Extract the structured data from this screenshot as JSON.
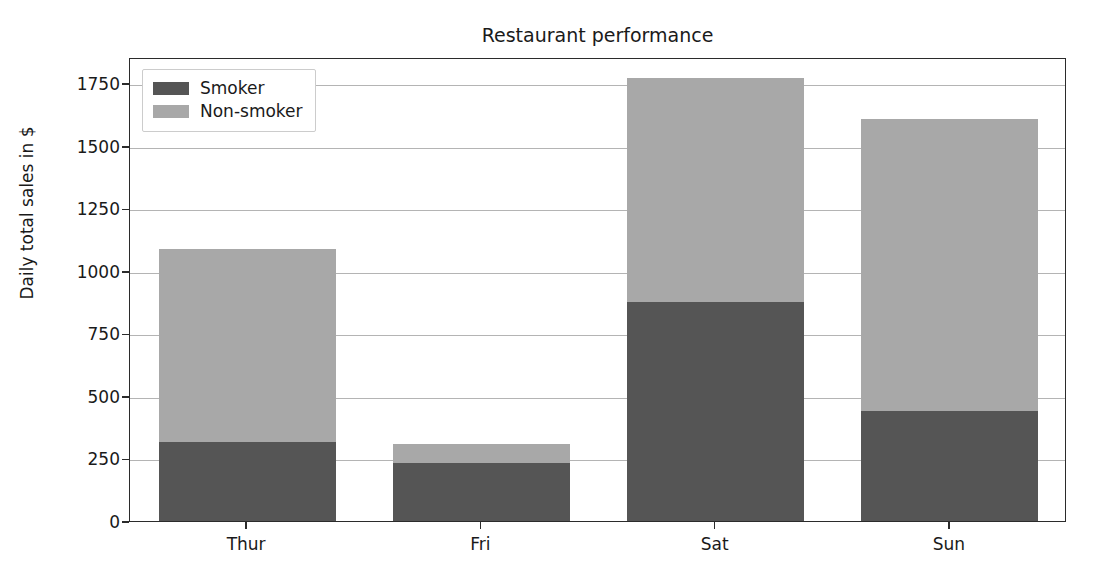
{
  "chart_data": {
    "type": "bar",
    "subtype": "stacked-vertical",
    "title": "Restaurant performance",
    "xlabel": "",
    "ylabel": "Daily total sales in $",
    "categories": [
      "Thur",
      "Fri",
      "Sat",
      "Sun"
    ],
    "series": [
      {
        "name": "Smoker",
        "color": "#555555",
        "values": [
          324,
          240,
          883,
          448
        ]
      },
      {
        "name": "Non-smoker",
        "color": "#a8a8a8",
        "values": [
          772,
          77,
          895,
          1166
        ]
      }
    ],
    "totals": [
      1096,
      317,
      1778,
      1614
    ],
    "ylim": [
      0,
      1855
    ],
    "yticks": [
      0,
      250,
      500,
      750,
      1000,
      1250,
      1500,
      1750
    ],
    "ytick_labels": [
      "0",
      "250",
      "500",
      "750",
      "1000",
      "1250",
      "1500",
      "1750"
    ],
    "grid": "horizontal",
    "grid_color": "#b4b4b4",
    "legend_position": "upper left",
    "background": "#ffffff",
    "axis_color": "#2b2b2b"
  },
  "legend": {
    "entries": [
      {
        "label": "Smoker",
        "color": "#555555"
      },
      {
        "label": "Non-smoker",
        "color": "#a8a8a8"
      }
    ]
  }
}
